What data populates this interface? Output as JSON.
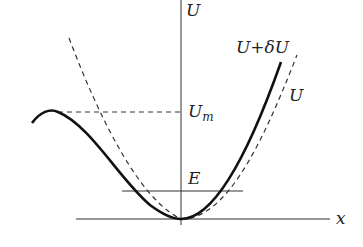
{
  "diagram": {
    "labels": {
      "y_axis": "U",
      "x_axis": "x",
      "perturbed_curve": "U+δU",
      "original_curve": "U",
      "barrier_level": "U",
      "barrier_level_sub": "m",
      "energy_level": "E"
    },
    "colors": {
      "stroke": "#222222",
      "background": "#ffffff"
    }
  }
}
